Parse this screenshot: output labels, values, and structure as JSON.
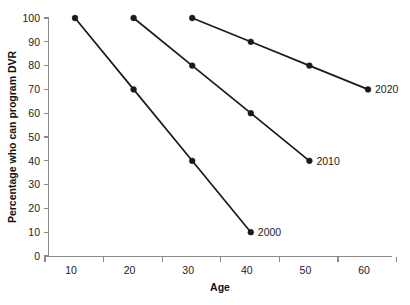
{
  "chart_data": {
    "type": "line",
    "title": "",
    "xlabel": "Age",
    "ylabel": "Percentage who can program DVR",
    "x": [
      10,
      20,
      30,
      40,
      50,
      60
    ],
    "xticklabels": [
      "10",
      "20",
      "30",
      "40",
      "50",
      "60"
    ],
    "yticklabels": [
      "0",
      "10",
      "20",
      "30",
      "40",
      "50",
      "60",
      "70",
      "80",
      "90",
      "100"
    ],
    "yticks": [
      0,
      10,
      20,
      30,
      40,
      50,
      60,
      70,
      80,
      90,
      100
    ],
    "xlim": [
      5,
      65
    ],
    "ylim": [
      0,
      100
    ],
    "grid": false,
    "legend_position": "inline-right-of-last-point",
    "marker": "filled-circle",
    "line_color": "#1a1a1a",
    "axis_color": "#8a8a8a",
    "series": [
      {
        "name": "2000",
        "label": "2000",
        "x": [
          10,
          20,
          30,
          40
        ],
        "values": [
          100,
          70,
          40,
          10
        ],
        "label_anchor": {
          "x": 40,
          "y": 10
        }
      },
      {
        "name": "2010",
        "label": "2010",
        "x": [
          20,
          30,
          40,
          50
        ],
        "values": [
          100,
          80,
          60,
          40
        ],
        "label_anchor": {
          "x": 50,
          "y": 40
        }
      },
      {
        "name": "2020",
        "label": "2020",
        "x": [
          30,
          40,
          50,
          60
        ],
        "values": [
          100,
          90,
          80,
          70
        ],
        "label_anchor": {
          "x": 60,
          "y": 70
        }
      }
    ]
  }
}
